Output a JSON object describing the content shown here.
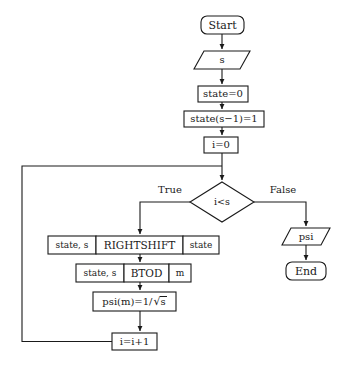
{
  "diagram": {
    "stroke_color": "#1a1a1a",
    "fill_color": "#ffffff",
    "nodes": {
      "start": {
        "label": "Start",
        "shape": "terminal"
      },
      "input_s": {
        "label": "s",
        "shape": "parallelogram"
      },
      "state_init": {
        "label": "state=0",
        "shape": "process"
      },
      "state_set": {
        "label": "state(s−1)=1",
        "shape": "process"
      },
      "i_init": {
        "label": "i=0",
        "shape": "process"
      },
      "decision": {
        "label": "i<s",
        "shape": "decision"
      },
      "rightshift": {
        "shape": "subroutine",
        "inputs": "state, s",
        "name": "RIGHTSHIFT",
        "outputs": "state"
      },
      "btod": {
        "shape": "subroutine",
        "inputs": "state, s",
        "name": "BTOD",
        "outputs": "m"
      },
      "psi_assign": {
        "shape": "process",
        "prefix": "psi(m)=1/",
        "radicand": "s",
        "label": "psi(m)=1/√s"
      },
      "i_increment": {
        "label": "i=i+1",
        "shape": "process"
      },
      "output_psi": {
        "label": "psi",
        "shape": "parallelogram"
      },
      "end": {
        "label": "End",
        "shape": "terminal"
      }
    },
    "branches": {
      "true_label": "True",
      "false_label": "False"
    }
  }
}
